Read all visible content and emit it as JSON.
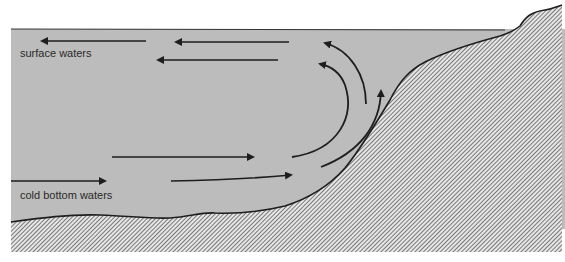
{
  "diagram": {
    "labels": {
      "surface": "surface waters",
      "bottom": "cold bottom waters"
    },
    "colors": {
      "water": "#bcbcbc",
      "background": "#ffffff",
      "line": "#1e1e1e",
      "hatch": "#555555"
    }
  }
}
